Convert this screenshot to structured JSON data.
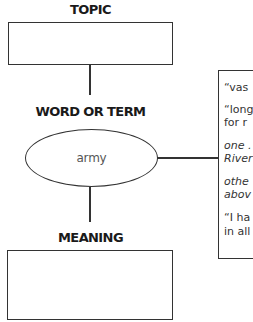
{
  "diagram": {
    "topic": {
      "heading": "TOPIC",
      "box_value": ""
    },
    "word_or_term": {
      "heading": "WORD OR TERM",
      "value": "army"
    },
    "meaning": {
      "heading": "MEANING",
      "box_value": ""
    },
    "context_panel": {
      "entries": [
        {
          "lines": [
            "“vas"
          ],
          "style": "normal"
        },
        {
          "lines": [
            "“long",
            "for r"
          ],
          "style": "normal"
        },
        {
          "lines": [
            "one .",
            "River"
          ],
          "style": "italic"
        },
        {
          "lines": [
            "othe",
            "abov"
          ],
          "style": "italic"
        },
        {
          "lines": [
            "“I ha",
            "in all"
          ],
          "style": "normal"
        }
      ]
    },
    "colors": {
      "stroke": "#333333",
      "heading_text": "#1a1a1a",
      "ellipse_text": "#555555",
      "background": "#ffffff"
    }
  }
}
